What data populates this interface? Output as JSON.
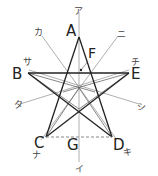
{
  "diagram": {
    "type": "pentagram-with-symmetry-axes",
    "points": {
      "A": {
        "label": "A",
        "x": 79,
        "y": 37
      },
      "B": {
        "label": "B",
        "x": 28,
        "y": 73
      },
      "E": {
        "label": "E",
        "x": 129,
        "y": 73
      },
      "C": {
        "label": "C",
        "x": 46,
        "y": 137
      },
      "D": {
        "label": "D",
        "x": 112,
        "y": 137
      },
      "G": {
        "label": "G",
        "x": 79,
        "y": 137
      },
      "F": {
        "label": "F",
        "x": 81,
        "y": 70
      }
    },
    "center": {
      "x": 79,
      "y": 88
    },
    "axis_labels": {
      "a": "ア",
      "i": "イ",
      "ka": "カ",
      "ki": "キ",
      "sa": "サ",
      "shi": "シ",
      "ta": "タ",
      "chi": "チ",
      "na": "ナ",
      "ni": "ニ"
    },
    "colors": {
      "star_line": "#222222",
      "axis_line": "#999999",
      "dashed_line": "#888888",
      "text": "#222222"
    }
  }
}
